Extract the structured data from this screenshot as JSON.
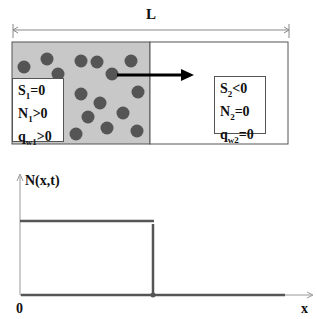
{
  "top_diagram": {
    "length_label": "L",
    "left_region": {
      "fill": "#c8c8c8",
      "label_lines": [
        {
          "var": "S",
          "sub": "1",
          "rel": "=0"
        },
        {
          "var": "N",
          "sub": "1",
          "rel": ">0"
        },
        {
          "var": "q",
          "sub": "w1",
          "rel": ">0"
        }
      ]
    },
    "right_region": {
      "fill": "#ffffff",
      "label_lines": [
        {
          "var": "S",
          "sub": "2",
          "rel": "<0"
        },
        {
          "var": "N",
          "sub": "2",
          "rel": "=0"
        },
        {
          "var": "q",
          "sub": "w2",
          "rel": "=0"
        }
      ]
    },
    "particle_color": "#555555",
    "particle_count": 15,
    "arrow": "right"
  },
  "graph": {
    "y_axis_label": "N(x,t)",
    "x_axis_label": "x",
    "origin_label": "0",
    "profile": "step function: constant N>0 for x < front, 0 beyond"
  }
}
